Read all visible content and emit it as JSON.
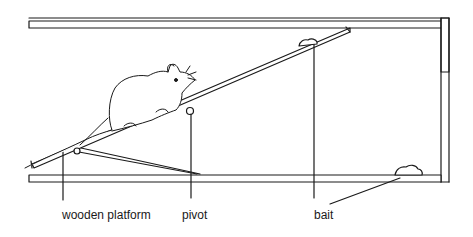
{
  "diagram": {
    "labels": {
      "wooden_platform": "wooden platform",
      "pivot": "pivot",
      "bait": "bait"
    },
    "colors": {
      "line": "#1a1a1a",
      "background": "#ffffff"
    }
  }
}
